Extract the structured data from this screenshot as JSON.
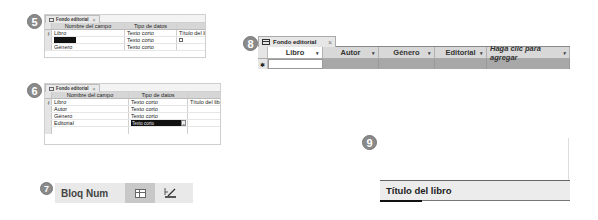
{
  "steps": {
    "s5": "5",
    "s6": "6",
    "s7": "7",
    "s8": "8",
    "s9": "9"
  },
  "design_view_1": {
    "tab_label": "Fondo editorial",
    "close": "×",
    "headers": [
      "Nombre del campo",
      "Tipo de datos",
      ""
    ],
    "rows": [
      {
        "key": "⚷",
        "name": "Libro",
        "type": "Texto corto",
        "desc": "Título del libro"
      },
      {
        "key": "",
        "name": "Autor",
        "type": "Texto corto",
        "desc": ""
      },
      {
        "key": "",
        "name": "Género",
        "type": "Texto corto",
        "desc": ""
      }
    ]
  },
  "design_view_2": {
    "tab_label": "Fondo editorial",
    "close": "×",
    "headers": [
      "Nombre del campo",
      "Tipo de datos",
      ""
    ],
    "rows": [
      {
        "key": "⚷",
        "name": "Libro",
        "type": "Texto corto",
        "desc": "Título del libro"
      },
      {
        "key": "",
        "name": "Autor",
        "type": "Texto corto",
        "desc": ""
      },
      {
        "key": "",
        "name": "Género",
        "type": "Texto corto",
        "desc": ""
      },
      {
        "key": "",
        "name": "Editorial",
        "type": "Texto corto",
        "desc": ""
      }
    ],
    "dropdown_arrow": "⌄"
  },
  "status_bar": {
    "label": "Bloq Num"
  },
  "datasheet": {
    "tab_label": "Fondo editorial",
    "close": "×",
    "columns": [
      "Libro",
      "Autor",
      "Género",
      "Editorial",
      "Haga clic para agregar"
    ],
    "arrow": "▾",
    "new_row_marker": "✱"
  },
  "property": {
    "caption": "Título del libro"
  }
}
